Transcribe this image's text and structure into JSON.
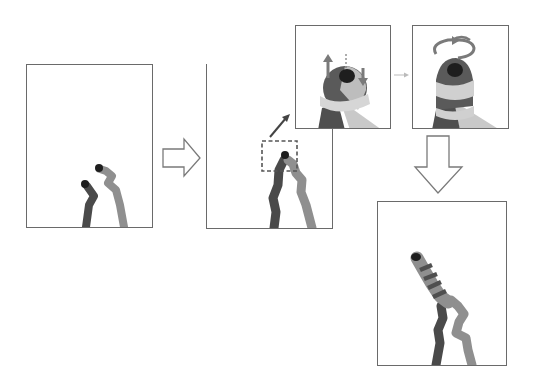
{
  "figure": {
    "description": "Step-by-step illustration of two strands growing from the bottom; a zoomed inset shows one tip bending (up/down arrows) and then wrapping with a rotation arrow, resulting in a coiled strand wrapping around the other.",
    "colors": {
      "frame": "#6a6a6a",
      "dark_strand": "#4a4a4a",
      "light_strand": "#9a9a9a",
      "very_light_band": "#cfcfcf",
      "tip": "#1e1e1e",
      "arrow_outline": "#7a7a7a"
    },
    "panels": [
      {
        "id": "panel-1",
        "label": "initial two strands",
        "box": [
          26,
          64,
          126,
          163
        ]
      },
      {
        "id": "panel-2",
        "label": "strands approaching, contact region highlighted",
        "box": [
          206,
          64,
          126,
          164
        ]
      },
      {
        "id": "panel-3",
        "label": "zoomed inset: tip bending",
        "box": [
          295,
          25,
          95,
          103
        ],
        "icons": [
          "up-arrow",
          "down-arrow",
          "pivot-dashed-line"
        ]
      },
      {
        "id": "panel-4",
        "label": "zoomed inset: tip rotating / wrapping",
        "box": [
          412,
          25,
          96,
          103
        ],
        "icons": [
          "rotation-arrow"
        ]
      },
      {
        "id": "panel-5",
        "label": "final coiled strand",
        "box": [
          377,
          201,
          129,
          164
        ]
      }
    ],
    "connectors": [
      {
        "id": "arrow-right-hollow",
        "from": "panel-1",
        "to": "panel-2"
      },
      {
        "id": "arrow-zoom-diagonal",
        "from": "panel-2",
        "to": "panel-3"
      },
      {
        "id": "arrow-small-right",
        "from": "panel-3",
        "to": "panel-4"
      },
      {
        "id": "arrow-down-hollow",
        "from": "panel-4",
        "to": "panel-5"
      }
    ]
  }
}
